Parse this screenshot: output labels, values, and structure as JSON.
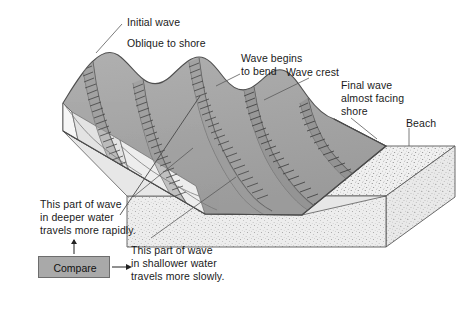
{
  "figure": {
    "width": 470,
    "height": 320,
    "background_color": "#ffffff"
  },
  "colors": {
    "water": "#a6a6a6",
    "water_shadow": "#8f8f8f",
    "water_highlight": "#b8b8b8",
    "sand": "#efefef",
    "sand_side": "#e4e4e4",
    "sand_front": "#ebebeb",
    "outline": "#4a4a4a",
    "text": "#1a1a1a",
    "compare_box_fill": "#a9a9a9",
    "compare_box_border": "#6d6d6d"
  },
  "labels": {
    "initial_wave": "Initial wave",
    "oblique_to_shore": "Oblique to shore",
    "wave_begins_to_bend_line1": "Wave begins",
    "wave_begins_to_bend_line2": "to bend",
    "wave_crest": "Wave crest",
    "final_wave_line1": "Final wave",
    "final_wave_line2": "almost facing",
    "final_wave_line3": "shore",
    "beach": "Beach",
    "deeper_line1": "This part of wave",
    "deeper_line2": "in deeper water",
    "deeper_line3": "travels more rapidly.",
    "shallower_line1": "This part of wave",
    "shallower_line2": "in shallower water",
    "shallower_line3": "travels more slowly.",
    "compare": "Compare"
  },
  "diagram_elements": {
    "wave_count": 5,
    "block_type": "3d-block-diagram",
    "water_surface": "wavy crested sea surface oblique to shore",
    "beach_surface": "stippled sand wedge along right/front edge"
  }
}
